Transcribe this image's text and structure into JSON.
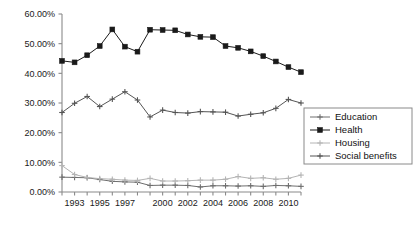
{
  "chart_data": {
    "type": "line",
    "title": "",
    "subtitle": "",
    "xlabel": "",
    "ylabel": "",
    "x": [
      1992,
      1993,
      1994,
      1995,
      1996,
      1997,
      1998,
      1999,
      2000,
      2001,
      2002,
      2003,
      2004,
      2005,
      2006,
      2007,
      2008,
      2009,
      2010,
      2011
    ],
    "xtick_labels": [
      "",
      "1993",
      "",
      "1995",
      "",
      "1997",
      "",
      "",
      "2000",
      "",
      "2002",
      "",
      "2004",
      "",
      "2006",
      "",
      "2008",
      "",
      "2010",
      ""
    ],
    "xlim": [
      1992,
      2011
    ],
    "ylim": [
      0,
      60
    ],
    "ytick_values": [
      0,
      10,
      20,
      30,
      40,
      50,
      60
    ],
    "ytick_labels": [
      "0.00%",
      "10.00%",
      "20.00%",
      "30.00%",
      "40.00%",
      "50.00%",
      "60.00%"
    ],
    "grid": false,
    "legend_position": "right",
    "series": [
      {
        "name": "Education",
        "color": "#6e6e6e",
        "marker": "plus",
        "values": [
          5.0,
          4.9,
          4.8,
          4.2,
          3.6,
          3.4,
          3.3,
          2.2,
          2.3,
          2.3,
          2.2,
          1.7,
          2.1,
          2.1,
          2.0,
          2.1,
          1.9,
          2.2,
          2.1,
          1.9
        ]
      },
      {
        "name": "Health",
        "color": "#1a1a1a",
        "marker": "square",
        "values": [
          44.2,
          43.7,
          46.1,
          49.2,
          54.8,
          49.0,
          47.3,
          54.7,
          54.6,
          54.5,
          53.1,
          52.3,
          52.2,
          49.2,
          48.6,
          47.4,
          45.8,
          44.0,
          42.1,
          40.4
        ]
      },
      {
        "name": "Housing",
        "color": "#b4b4b4",
        "marker": "plus",
        "values": [
          8.9,
          5.9,
          4.9,
          4.5,
          4.3,
          4.0,
          3.9,
          4.6,
          3.7,
          3.7,
          3.8,
          4.0,
          4.0,
          4.3,
          5.2,
          4.6,
          4.8,
          4.3,
          4.6,
          5.7
        ]
      },
      {
        "name": "Social benefits",
        "color": "#555555",
        "marker": "plus",
        "values": [
          26.8,
          29.9,
          32.2,
          28.8,
          31.3,
          33.8,
          31.0,
          25.3,
          27.6,
          26.8,
          26.6,
          27.1,
          27.0,
          26.9,
          25.6,
          26.2,
          26.7,
          28.2,
          31.2,
          30.0
        ]
      }
    ],
    "legend": [
      {
        "label": "Education",
        "color": "#6e6e6e",
        "marker": "plus"
      },
      {
        "label": "Health",
        "color": "#1a1a1a",
        "marker": "square"
      },
      {
        "label": "Housing",
        "color": "#b4b4b4",
        "marker": "plus"
      },
      {
        "label": "Social benefits",
        "color": "#555555",
        "marker": "plus"
      }
    ]
  },
  "colors": {
    "background": "#ffffff",
    "axis": "#8a8a8a",
    "tick_text": "#1a1a1a",
    "legend_border": "#8a8a8a"
  }
}
